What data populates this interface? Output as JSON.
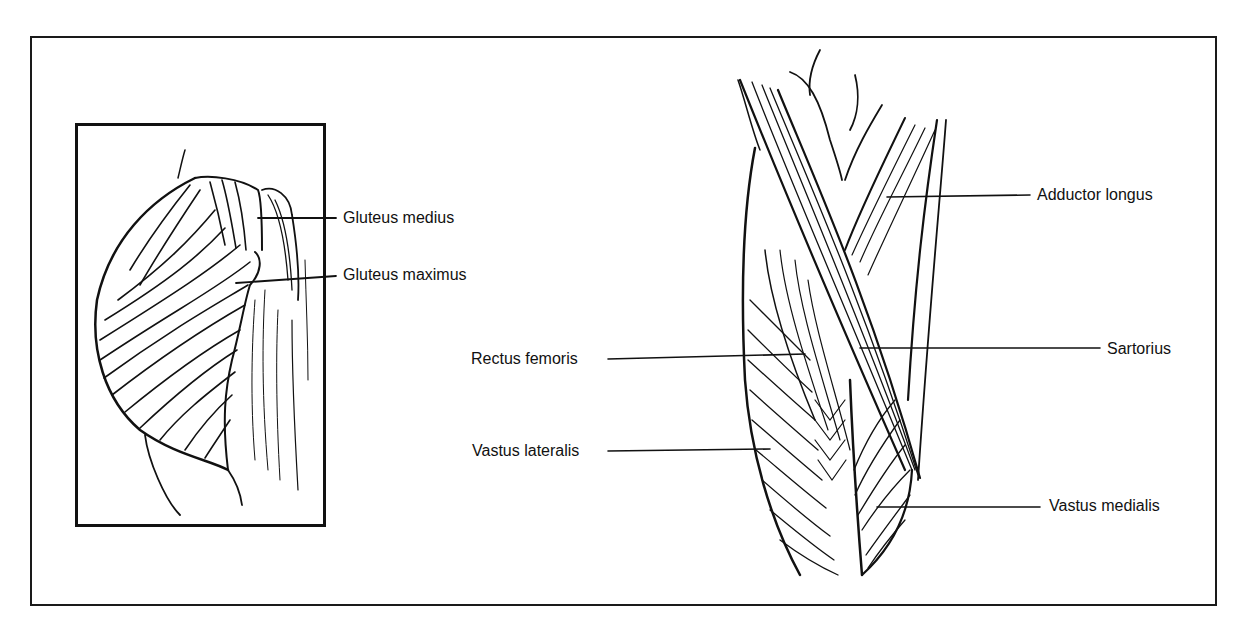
{
  "figure": {
    "frame_color": "#111111",
    "panels": [
      {
        "id": "gluteal-inset",
        "labels": [
          {
            "text": "Gluteus medius"
          },
          {
            "text": "Gluteus maximus"
          }
        ]
      },
      {
        "id": "thigh-anterior",
        "labels_left": [
          {
            "text": "Rectus femoris"
          },
          {
            "text": "Vastus lateralis"
          }
        ],
        "labels_right": [
          {
            "text": "Adductor longus"
          },
          {
            "text": "Sartorius"
          },
          {
            "text": "Vastus medialis"
          }
        ]
      }
    ]
  }
}
